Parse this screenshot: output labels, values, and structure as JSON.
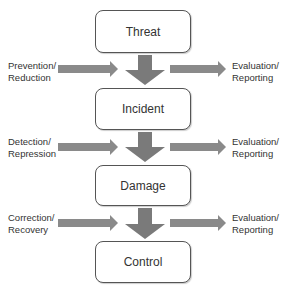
{
  "diagram": {
    "stages": [
      {
        "label": "Threat"
      },
      {
        "label": "Incident"
      },
      {
        "label": "Damage"
      },
      {
        "label": "Control"
      }
    ],
    "transitions": [
      {
        "input": [
          "Prevention/",
          "Reduction"
        ],
        "output": [
          "Evaluation/",
          "Reporting"
        ]
      },
      {
        "input": [
          "Detection/",
          "Repression"
        ],
        "output": [
          "Evaluation/",
          "Reporting"
        ]
      },
      {
        "input": [
          "Correction/",
          "Recovery"
        ],
        "output": [
          "Evaluation/",
          "Reporting"
        ]
      }
    ],
    "colors": {
      "arrow": "#7a7a7a",
      "box_border": "#555555",
      "text": "#333333"
    }
  }
}
